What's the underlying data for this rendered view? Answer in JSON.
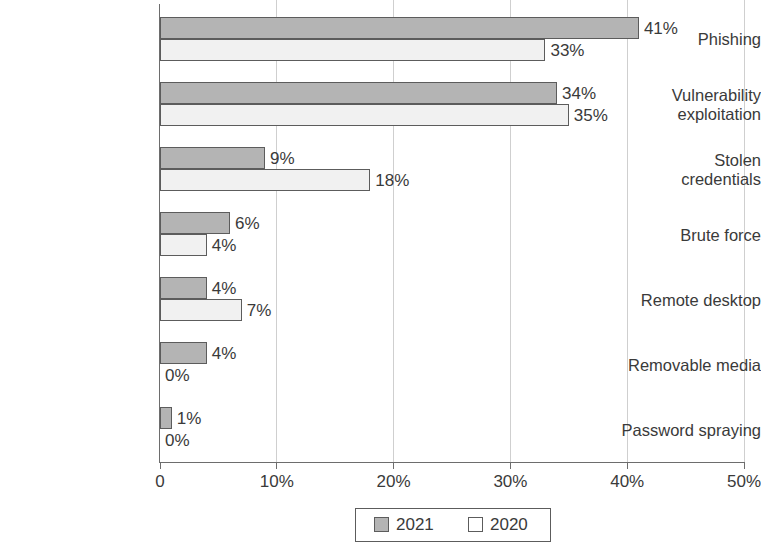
{
  "chart_data": {
    "type": "bar",
    "orientation": "horizontal",
    "title": "",
    "subtitle": "",
    "xlabel": "",
    "ylabel": "",
    "xlim": [
      0,
      50
    ],
    "xticks": [
      0,
      10,
      20,
      30,
      40,
      50
    ],
    "xtick_labels": [
      "0",
      "10%",
      "20%",
      "30%",
      "40%",
      "50%"
    ],
    "grid": true,
    "grid_axis": "x",
    "legend_position": "bottom-center",
    "categories": [
      "Phishing",
      "Vulnerability\nexploitation",
      "Stolen\ncredentials",
      "Brute force",
      "Remote desktop",
      "Removable media",
      "Password spraying"
    ],
    "series": [
      {
        "name": "2021",
        "color": "#b4b4b4",
        "values": [
          41,
          34,
          9,
          6,
          4,
          4,
          1
        ],
        "labels": [
          "41%",
          "34%",
          "9%",
          "6%",
          "4%",
          "4%",
          "1%"
        ]
      },
      {
        "name": "2020",
        "color": "#f1f1f1",
        "values": [
          33,
          35,
          18,
          4,
          7,
          0,
          0
        ],
        "labels": [
          "33%",
          "35%",
          "18%",
          "4%",
          "7%",
          "0%",
          "0%"
        ]
      }
    ]
  },
  "legend": {
    "entries": [
      {
        "label": "2021",
        "swatch": "series-2021-swatch"
      },
      {
        "label": "2020",
        "swatch": "series-2020-swatch"
      }
    ]
  }
}
